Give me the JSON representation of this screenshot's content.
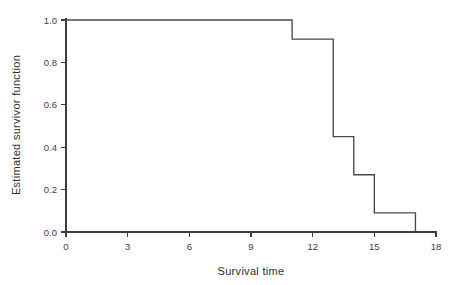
{
  "chart_data": {
    "type": "line",
    "title": "",
    "subtitle": "",
    "xlabel": "Survival  time",
    "ylabel": "Estimated  survivor  function",
    "xlim": [
      0,
      18
    ],
    "ylim": [
      0.0,
      1.0
    ],
    "grid": false,
    "legend": null,
    "style": "step-post",
    "xticks": [
      0,
      3,
      6,
      9,
      12,
      15,
      18
    ],
    "xticklabels": [
      "0",
      "3",
      "6",
      "9",
      "12",
      "15",
      "18"
    ],
    "yticks": [
      0.0,
      0.2,
      0.4,
      0.6,
      0.8,
      1.0
    ],
    "yticklabels": [
      "0.0",
      "0.2",
      "0.4",
      "0.6",
      "0.8",
      "1.0"
    ],
    "series": [
      {
        "name": "Estimated survivor function",
        "color": "#4a4a4a",
        "x": [
          0,
          11,
          11,
          13,
          13,
          14,
          14,
          15,
          15,
          17,
          17
        ],
        "y": [
          1.0,
          1.0,
          0.91,
          0.91,
          0.45,
          0.45,
          0.27,
          0.27,
          0.09,
          0.09,
          0.0
        ],
        "steps": [
          {
            "time": 0,
            "survival": 1.0
          },
          {
            "time": 11,
            "survival": 0.91
          },
          {
            "time": 13,
            "survival": 0.45
          },
          {
            "time": 14,
            "survival": 0.27
          },
          {
            "time": 15,
            "survival": 0.09
          },
          {
            "time": 17,
            "survival": 0.0
          }
        ]
      }
    ]
  },
  "axes": {
    "x_title": "Survival  time",
    "y_title": "Estimated  survivor  function",
    "axis_color": "#3d3d3d"
  }
}
